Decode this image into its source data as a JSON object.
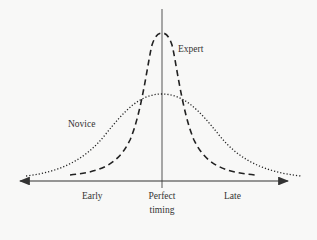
{
  "diagram": {
    "type": "timing-distribution",
    "labels": {
      "expert": "Expert",
      "novice": "Novice",
      "early": "Early",
      "perfect_line1": "Perfect",
      "perfect_line2": "timing",
      "late": "Late"
    },
    "series": [
      {
        "name": "Expert",
        "style": "dashed",
        "peak": "narrow, tall",
        "center": "Perfect timing"
      },
      {
        "name": "Novice",
        "style": "dotted",
        "peak": "wide, low",
        "center": "Perfect timing"
      }
    ],
    "axes": {
      "horizontal": "double-arrow timing axis (Early ← → Late)",
      "vertical": "line at Perfect timing"
    },
    "colors": {
      "line": "#222222",
      "axis": "#444444",
      "background": "#f8f8f7"
    }
  }
}
